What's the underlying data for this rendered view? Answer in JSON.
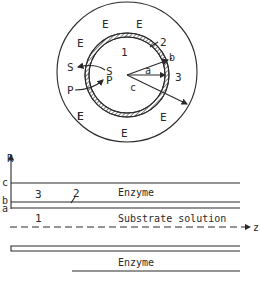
{
  "figure": {
    "type": "enzyme hollow-fiber reactor schematic",
    "cross_section": {
      "regions": [
        {
          "id": "1",
          "label": "1",
          "meaning": "lumen (substrate solution)"
        },
        {
          "id": "2",
          "label": "2",
          "meaning": "membrane wall"
        },
        {
          "id": "3",
          "label": "3",
          "meaning": "shell (enzyme)"
        }
      ],
      "enzyme_label": "E",
      "enzyme_label_count": 8,
      "species": {
        "substrate": "S",
        "product": "P"
      },
      "radii": {
        "a": "a",
        "b": "b",
        "c": "c"
      }
    },
    "longitudinal_section": {
      "axis_r": "R",
      "axis_z": "z",
      "radius_labels": [
        "c",
        "b",
        "a"
      ],
      "region_labels": {
        "shell": "3",
        "membrane": "2",
        "lumen": "1"
      },
      "top_text": "Enzyme",
      "middle_text": "Substrate solution",
      "bottom_text": "Enzyme"
    },
    "colors": {
      "line": "#2a2a2a",
      "background": "#ffffff"
    }
  }
}
